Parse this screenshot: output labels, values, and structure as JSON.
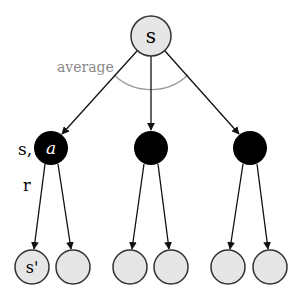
{
  "diagram": {
    "type": "backup-diagram",
    "colors": {
      "state_fill": "#e6e6e6",
      "state_stroke": "#333333",
      "action_fill": "#000000",
      "edge": "#111111",
      "average_arc": "#999999",
      "average_label": "#888888"
    },
    "root": {
      "label": "s",
      "cx": 151,
      "cy": 36,
      "r": 20
    },
    "average_label": "average",
    "side_labels": {
      "state_action": "s,",
      "reward": "r"
    },
    "actions": [
      {
        "label": "a",
        "cx": 51,
        "cy": 148,
        "r": 17
      },
      {
        "label": "",
        "cx": 151,
        "cy": 148,
        "r": 17
      },
      {
        "label": "",
        "cx": 250,
        "cy": 148,
        "r": 17
      }
    ],
    "leaves": [
      {
        "label": "s'",
        "cx": 32,
        "cy": 267,
        "r": 17,
        "parent": 0
      },
      {
        "label": "",
        "cx": 73,
        "cy": 267,
        "r": 17,
        "parent": 0
      },
      {
        "label": "",
        "cx": 130,
        "cy": 267,
        "r": 17,
        "parent": 1
      },
      {
        "label": "",
        "cx": 171,
        "cy": 267,
        "r": 17,
        "parent": 1
      },
      {
        "label": "",
        "cx": 228,
        "cy": 267,
        "r": 17,
        "parent": 2
      },
      {
        "label": "",
        "cx": 270,
        "cy": 267,
        "r": 17,
        "parent": 2
      }
    ]
  }
}
